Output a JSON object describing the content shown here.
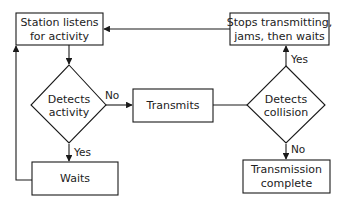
{
  "diagram": {
    "nodes": {
      "listen": {
        "type": "process",
        "lines": [
          "Station listens",
          "for activity"
        ]
      },
      "detect_activity": {
        "type": "decision",
        "lines": [
          "Detects",
          "activity"
        ]
      },
      "waits": {
        "type": "process",
        "lines": [
          "Waits"
        ]
      },
      "transmits": {
        "type": "process",
        "lines": [
          "Transmits"
        ]
      },
      "detect_collision": {
        "type": "decision",
        "lines": [
          "Detects",
          "collision"
        ]
      },
      "stops": {
        "type": "process",
        "lines": [
          "Stops transmitting,",
          "jams, then waits"
        ]
      },
      "complete": {
        "type": "process",
        "lines": [
          "Transmission",
          "complete"
        ]
      }
    },
    "edges": [
      {
        "from": "listen",
        "to": "detect_activity",
        "label": ""
      },
      {
        "from": "detect_activity",
        "to": "transmits",
        "label": "No"
      },
      {
        "from": "detect_activity",
        "to": "waits",
        "label": "Yes"
      },
      {
        "from": "waits",
        "to": "listen",
        "label": ""
      },
      {
        "from": "transmits",
        "to": "detect_collision",
        "label": ""
      },
      {
        "from": "detect_collision",
        "to": "stops",
        "label": "Yes"
      },
      {
        "from": "detect_collision",
        "to": "complete",
        "label": "No"
      },
      {
        "from": "stops",
        "to": "listen",
        "label": ""
      }
    ],
    "colors": {
      "stroke": "#1a1a1a",
      "text": "#222222",
      "background": "#ffffff"
    }
  }
}
